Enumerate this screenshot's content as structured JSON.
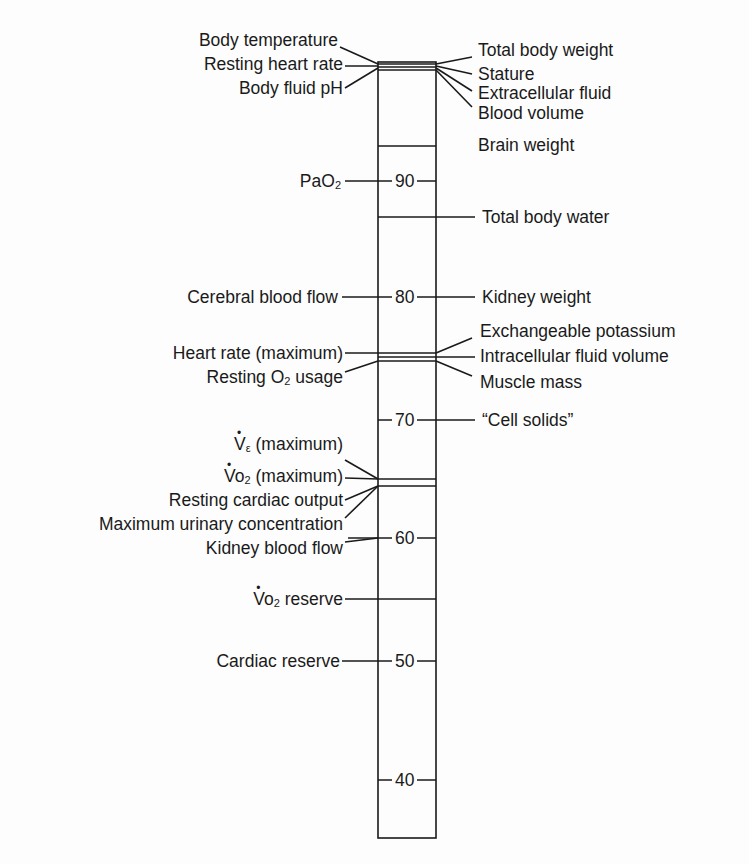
{
  "diagram": {
    "type": "vertical-scale-diagram",
    "scale": {
      "ticks": [
        90,
        80,
        70,
        60,
        50,
        40
      ],
      "column": {
        "x_left": 378,
        "x_right": 436,
        "y_top": 62,
        "y_bottom": 838
      }
    },
    "left_labels": [
      {
        "text": "Body temperature",
        "y": 40
      },
      {
        "text": "Resting heart rate",
        "y": 64
      },
      {
        "text": "Body fluid pH",
        "y": 88
      },
      {
        "text": "PaO",
        "sub": "2",
        "y": 181
      },
      {
        "text": "Cerebral blood flow",
        "y": 297
      },
      {
        "text": "Heart rate (maximum)",
        "y": 353
      },
      {
        "text": "Resting O",
        "sub": "2",
        "suffix": " usage",
        "y": 377
      },
      {
        "text": "V",
        "sub": "ε",
        "suffix": " (maximum)",
        "dot": true,
        "y": 444
      },
      {
        "text": "Vo",
        "sub": "2",
        "suffix": " (maximum)",
        "dot": true,
        "y": 478
      },
      {
        "text": "Resting cardiac output",
        "y": 501
      },
      {
        "text": "Maximum urinary concentration",
        "y": 525
      },
      {
        "text": "Kidney blood flow",
        "y": 549
      },
      {
        "text": "Vo",
        "sub": "2",
        "suffix": " reserve",
        "dot": true,
        "y": 599
      },
      {
        "text": "Cardiac reserve",
        "y": 661
      }
    ],
    "right_labels": [
      {
        "text": "Total body weight",
        "y": 50
      },
      {
        "text": "Stature",
        "y": 74
      },
      {
        "text": "Extracellular fluid",
        "y": 93
      },
      {
        "text": "Blood volume",
        "y": 113
      },
      {
        "text": "Brain weight",
        "y": 145
      },
      {
        "text": "Total body water",
        "y": 217
      },
      {
        "text": "Kidney weight",
        "y": 297
      },
      {
        "text": "Exchangeable potassium",
        "y": 331
      },
      {
        "text": "Intracellular fluid volume",
        "y": 356
      },
      {
        "text": "Muscle mass",
        "y": 382
      },
      {
        "text": "“Cell solids”",
        "y": 420
      }
    ]
  }
}
